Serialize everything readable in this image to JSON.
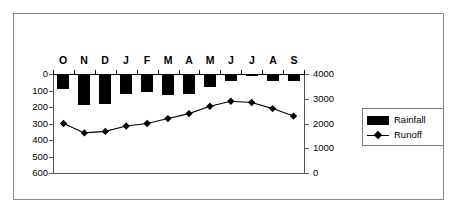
{
  "chart_data": {
    "type": "bar",
    "title": "",
    "subtitle": "",
    "xlabel": "",
    "ylabel": "",
    "grid": false,
    "legend_position": "right",
    "categories": [
      "O",
      "N",
      "D",
      "J",
      "F",
      "M",
      "A",
      "M",
      "J",
      "J",
      "A",
      "S"
    ],
    "series": [
      {
        "name": "Rainfall",
        "type": "bar",
        "axis": "left",
        "color": "#000000",
        "values": [
          90,
          185,
          180,
          120,
          110,
          125,
          120,
          80,
          45,
          12,
          40,
          45
        ]
      },
      {
        "name": "Runoff",
        "type": "line",
        "axis": "right",
        "color": "#000000",
        "marker": "diamond",
        "values": [
          2000,
          1620,
          1680,
          1900,
          2000,
          2200,
          2400,
          2700,
          2900,
          2850,
          2600,
          2300
        ]
      }
    ],
    "left_axis": {
      "label": "",
      "ticks": [
        "0",
        "100",
        "200",
        "300",
        "400",
        "500",
        "600"
      ],
      "tick_values": [
        0,
        100,
        200,
        300,
        400,
        500,
        600
      ],
      "min": 0,
      "max": 600,
      "inverted": true
    },
    "right_axis": {
      "label": "",
      "ticks": [
        "4000",
        "3000",
        "2000",
        "1000",
        "0"
      ],
      "tick_values": [
        4000,
        3000,
        2000,
        1000,
        0
      ],
      "min": 0,
      "max": 4000,
      "inverted": false
    },
    "legend": [
      {
        "label": "Rainfall",
        "marker": "filled-bar",
        "color": "#000000"
      },
      {
        "label": "Runoff",
        "marker": "line-diamond",
        "color": "#000000"
      }
    ]
  },
  "figure": {
    "frame_color": "#8a8a8a",
    "background": "#ffffff"
  }
}
